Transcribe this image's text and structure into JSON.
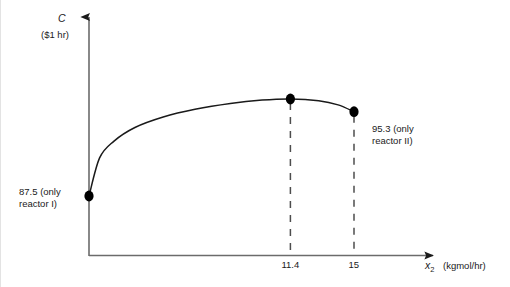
{
  "chart_data": {
    "type": "line",
    "title": "",
    "subtitle": "",
    "xlabel_symbol": "x",
    "xlabel_subscript": "2",
    "xlabel_units": "(kgmol/hr)",
    "ylabel_symbol": "C",
    "ylabel_units": "($1 hr)",
    "grid": false,
    "legend": "none",
    "xlim": [
      0,
      18.5
    ],
    "ylim": [
      0,
      1
    ],
    "x_ticks": [
      "11.4",
      "15"
    ],
    "x_tick_values": [
      11.4,
      15
    ],
    "y_ticks": [],
    "series": [
      {
        "name": "Total annual cost",
        "x": [
          0,
          0.6,
          1.4,
          2.6,
          4.2,
          6.0,
          8.0,
          9.8,
          11.4,
          13.0,
          14.1,
          15.0
        ],
        "y": [
          0.0,
          0.345,
          0.495,
          0.62,
          0.715,
          0.785,
          0.838,
          0.868,
          0.878,
          0.862,
          0.825,
          0.763
        ]
      }
    ],
    "points": [
      {
        "name": "origin-point",
        "x": 0,
        "y": 0.0,
        "label": "87.5 (only reactor I)"
      },
      {
        "name": "optimum-point",
        "x": 11.4,
        "y": 0.878,
        "label": ""
      },
      {
        "name": "end-point",
        "x": 15,
        "y": 0.763,
        "label": "95.3 (only reactor II)"
      }
    ],
    "annotations": [
      {
        "name": "left-annotation",
        "line1": "87.5 (only",
        "line2": "reactor I)",
        "value": 87.5
      },
      {
        "name": "right-annotation",
        "line1": "95.3 (only",
        "line2": "reactor II)",
        "value": 95.3
      }
    ],
    "dropline_x_values": [
      11.4,
      15
    ],
    "axis_style": "arrow",
    "colors": {
      "curve": "#1a1a1a",
      "axis": "#4d4d4d",
      "marker": "#000000",
      "dashed": "#4d4d4d",
      "text": "#1a1a1a",
      "background": "#ffffff",
      "frame": "#e3e3e3"
    }
  }
}
